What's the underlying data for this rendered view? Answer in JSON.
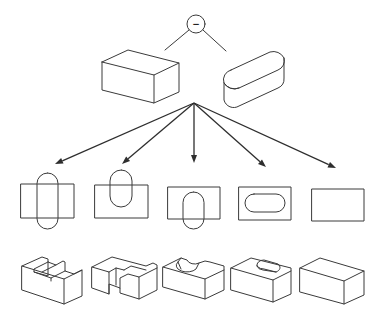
{
  "colors": {
    "stroke": "#3a3a3a",
    "arrow": "#2e2e2e",
    "background": "#ffffff"
  },
  "operation": {
    "symbol": "−",
    "name": "boolean-subtract",
    "circle": {
      "cx": 196,
      "cy": 24,
      "r": 9
    }
  },
  "operation_lines": [
    {
      "x1": 189,
      "y1": 30,
      "x2": 165,
      "y2": 50
    },
    {
      "x1": 203,
      "y1": 30,
      "x2": 226,
      "y2": 51
    }
  ],
  "inputs": {
    "box": {
      "label": "rectangular block",
      "faces": [
        "102,62 128,50 179,63 154,75 102,62",
        "102,62 102,90 154,103 154,75",
        "154,103 179,92 179,63"
      ]
    },
    "slot": {
      "label": "rounded slot (obround prism)",
      "top": "M 231 70 L 270 52 A 12 12 0 0 1 284 58 A 10 10 0 0 1 278 70 L 239 88 A 12 12 0 0 1 224 83 A 10 10 0 0 1 231 70 Z",
      "front": "M 224 83 L 224 100 A 10 10 0 0 0 239 106 L 278 88 A 10 10 0 0 0 284 78 L 284 58",
      "edge": "M 224 83 A 12 12 0 0 0 239 88"
    }
  },
  "arrows": {
    "origin": {
      "x": 194,
      "y": 103
    },
    "targets": [
      {
        "x": 55,
        "y": 164
      },
      {
        "x": 122,
        "y": 164
      },
      {
        "x": 194,
        "y": 163
      },
      {
        "x": 266,
        "y": 167
      },
      {
        "x": 336,
        "y": 168
      }
    ]
  },
  "plan_views": [
    {
      "label": "slot through both sides",
      "rect": {
        "x": 21,
        "y": 184,
        "w": 53,
        "h": 34
      },
      "capsule": {
        "x": 37,
        "y": 173,
        "w": 21,
        "h": 56
      }
    },
    {
      "label": "slot through back edge",
      "rect": {
        "x": 95,
        "y": 185,
        "w": 53,
        "h": 33
      },
      "capsule": {
        "x": 110,
        "y": 170,
        "w": 22,
        "h": 37
      }
    },
    {
      "label": "slot through front edge",
      "rect": {
        "x": 168,
        "y": 187,
        "w": 52,
        "h": 32
      },
      "capsule": {
        "x": 183,
        "y": 192,
        "w": 21,
        "h": 37
      }
    },
    {
      "label": "slot inside (pocket)",
      "rect": {
        "x": 239,
        "y": 187,
        "w": 52,
        "h": 33
      },
      "capsule": {
        "x": 245,
        "y": 194,
        "w": 40,
        "h": 18
      }
    },
    {
      "label": "no intersection",
      "rect": {
        "x": 312,
        "y": 189,
        "w": 52,
        "h": 32
      },
      "capsule": null
    }
  ],
  "results_3d": [
    {
      "label": "through channel",
      "paths": [
        "M 22 266 L 42 257 L 48 259 L 48 262 L 56 265 L 63 261 L 65 262 L 65 271 L 74 274 L 82 270 L 82 296 L 64 304 L 22 290 Z",
        "M 22 266 L 64 279 L 82 270",
        "M 64 279 L 64 304",
        "M 48 262 L 34 269 L 34 272 L 48 276 L 48 262",
        "M 56 265 L 42 272",
        "M 65 271 L 51 278 L 51 281",
        "M 34 272 L 51 278"
      ]
    },
    {
      "label": "U-shaped cut (open back)",
      "paths": [
        "M 92 267 L 112 257 L 146 266 L 153 263 L 157 265 L 157 290 L 139 299 L 120 293 L 120 288 L 109 284 L 109 294 L 92 288 Z",
        "M 92 267 L 109 272 L 109 294",
        "M 109 272 L 116 268 L 124 270",
        "M 116 268 L 116 285",
        "M 120 288 L 120 278 L 128 274 L 139 277 L 139 299",
        "M 139 277 L 157 268",
        "M 124 270 L 131 266 L 146 270"
      ]
    },
    {
      "label": "rounded notch (open front)",
      "paths": [
        "M 163 267 L 181 258 L 187 260 A 8 6 0 0 0 199 263 L 205 261 L 210 262 L 224 266 L 224 290 L 205 299 L 163 287 Z",
        "M 163 267 L 205 279 L 224 270",
        "M 205 279 L 205 299",
        "M 181 258 L 178 262 A 10 6 0 0 0 196 269 L 199 263",
        "M 178 262 L 181 269"
      ]
    },
    {
      "label": "obround pocket",
      "paths": [
        "M 231 268 L 251 258 L 291 268 L 291 294 L 273 302 L 231 290 Z",
        "M 231 268 L 273 280 L 291 271",
        "M 273 280 L 273 302",
        "M 257 266 A 7 5 0 0 1 264 260 L 278 264 A 7 5 0 0 1 276 272 L 263 270 A 7 5 0 0 1 257 266 Z",
        "M 258 267 A 7 4 0 0 0 264 269 L 276 272"
      ]
    },
    {
      "label": "unchanged block",
      "paths": [
        "M 300 268 L 320 258 L 364 271 L 364 295 L 344 304 L 300 292 Z",
        "M 300 268 L 344 281 L 364 271",
        "M 344 281 L 344 304"
      ]
    }
  ]
}
